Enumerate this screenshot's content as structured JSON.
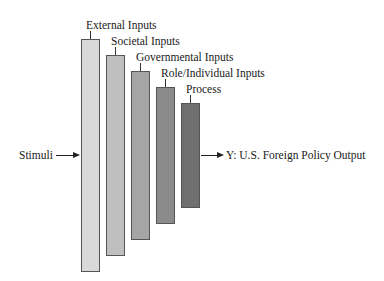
{
  "diagram": {
    "input_label": "Stimuli",
    "output_label": "Y: U.S. Foreign Policy Output",
    "stages": [
      {
        "label": "External Inputs",
        "color": "#d9d9d9",
        "left": 81,
        "top": 39,
        "bottom": 272,
        "label_left": 86,
        "label_top": 18
      },
      {
        "label": "Societal Inputs",
        "color": "#bfbfbf",
        "left": 106,
        "top": 55,
        "bottom": 256,
        "label_left": 111,
        "label_top": 34
      },
      {
        "label": "Governmental Inputs",
        "color": "#a5a5a5",
        "left": 131,
        "top": 71,
        "bottom": 240,
        "label_left": 136,
        "label_top": 50
      },
      {
        "label": "Role/Individual Inputs",
        "color": "#8b8b8b",
        "left": 156,
        "top": 87,
        "bottom": 224,
        "label_left": 161,
        "label_top": 66
      },
      {
        "label": "Process",
        "color": "#6f6f6f",
        "left": 181,
        "top": 103,
        "bottom": 208,
        "label_left": 186,
        "label_top": 82
      }
    ]
  }
}
